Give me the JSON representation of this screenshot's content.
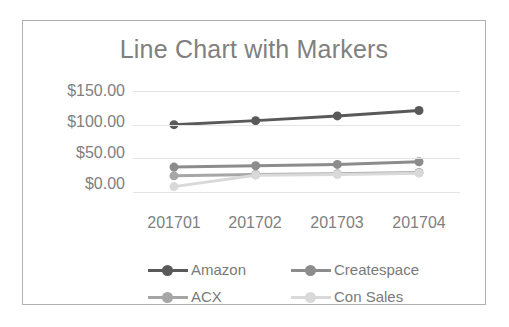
{
  "chart_data": {
    "type": "line",
    "title": "Line Chart with Markers",
    "xlabel": "",
    "ylabel": "",
    "categories": [
      "201701",
      "201702",
      "201703",
      "201704"
    ],
    "ytick_labels": [
      "$150.00",
      "$100.00",
      "$50.00",
      "$0.00"
    ],
    "ytick_values": [
      150,
      100,
      50,
      0
    ],
    "ylim": [
      0,
      150
    ],
    "grid": true,
    "legend_position": "bottom",
    "markers": true,
    "series": [
      {
        "name": "Amazon",
        "color": "#595959",
        "values": [
          100,
          106,
          113,
          121
        ]
      },
      {
        "name": "Createspace",
        "color": "#8c8c8c",
        "values": [
          37,
          39,
          41,
          45
        ]
      },
      {
        "name": "ACX",
        "color": "#a6a6a6",
        "values": [
          24,
          26,
          27,
          29
        ]
      },
      {
        "name": "Con Sales",
        "color": "#d9d9d9",
        "values": [
          8,
          25,
          26,
          28
        ]
      }
    ]
  },
  "style": {
    "title_color": "#808080",
    "axis_label_color": "#808080",
    "gridline_color": "#e4e4e4",
    "border_color": "#b0b0b0",
    "background": "#ffffff"
  }
}
